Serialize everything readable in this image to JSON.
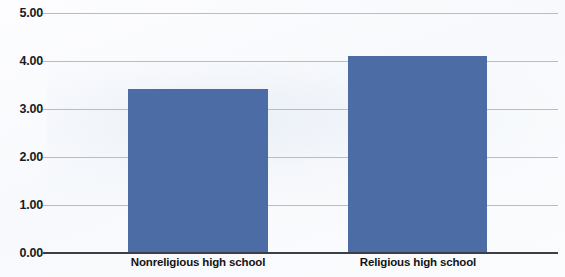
{
  "chart_data": {
    "type": "bar",
    "title": "",
    "subtitle": "",
    "xlabel": "",
    "ylabel": "",
    "categories": [
      "Nonreligious high school",
      "Religious high school"
    ],
    "values": [
      3.42,
      4.1
    ],
    "series": [
      {
        "name": "",
        "values": [
          3.42,
          4.1
        ]
      }
    ],
    "ylim": [
      0,
      5
    ],
    "ytick_labels": [
      "0.00",
      "1.00",
      "2.00",
      "3.00",
      "4.00",
      "5.00"
    ],
    "ytick_values": [
      0,
      1,
      2,
      3,
      4,
      5
    ],
    "ytick_step": 1,
    "grid": true,
    "grid_axis": "y",
    "legend": false,
    "legend_position": "none",
    "bar_color": "#4c6ca6",
    "gridline_color": "#b9bcc0",
    "axis_color": "#3c4044",
    "background_color": "#ffffff"
  },
  "axis": {
    "y_ticks": [
      {
        "label": "5.00",
        "value": 5
      },
      {
        "label": "4.00",
        "value": 4
      },
      {
        "label": "3.00",
        "value": 3
      },
      {
        "label": "2.00",
        "value": 2
      },
      {
        "label": "1.00",
        "value": 1
      },
      {
        "label": "0.00",
        "value": 0
      }
    ]
  },
  "bars": [
    {
      "category": "Nonreligious high school",
      "value": 3.42
    },
    {
      "category": "Religious high school",
      "value": 4.1
    }
  ]
}
